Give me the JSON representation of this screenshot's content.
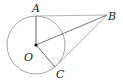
{
  "diagram": {
    "type": "geometry",
    "colors": {
      "circle": "#9a9a9a",
      "segments_dark": "#555555",
      "segments_light": "#aaaaaa",
      "point": "#111111",
      "label": "#222222"
    },
    "circle": {
      "center": "O",
      "cx": 36,
      "cy": 45,
      "r": 29
    },
    "points": {
      "A": {
        "label": "A",
        "x": 36,
        "y": 16
      },
      "B": {
        "label": "B",
        "x": 107,
        "y": 15
      },
      "C": {
        "label": "C",
        "x": 55,
        "y": 67
      },
      "O": {
        "label": "O",
        "x": 36,
        "y": 45
      }
    },
    "segments": [
      {
        "from": "O",
        "to": "A"
      },
      {
        "from": "O",
        "to": "B"
      },
      {
        "from": "O",
        "to": "C"
      },
      {
        "from": "A",
        "to": "B"
      },
      {
        "from": "B",
        "to": "C"
      }
    ]
  }
}
